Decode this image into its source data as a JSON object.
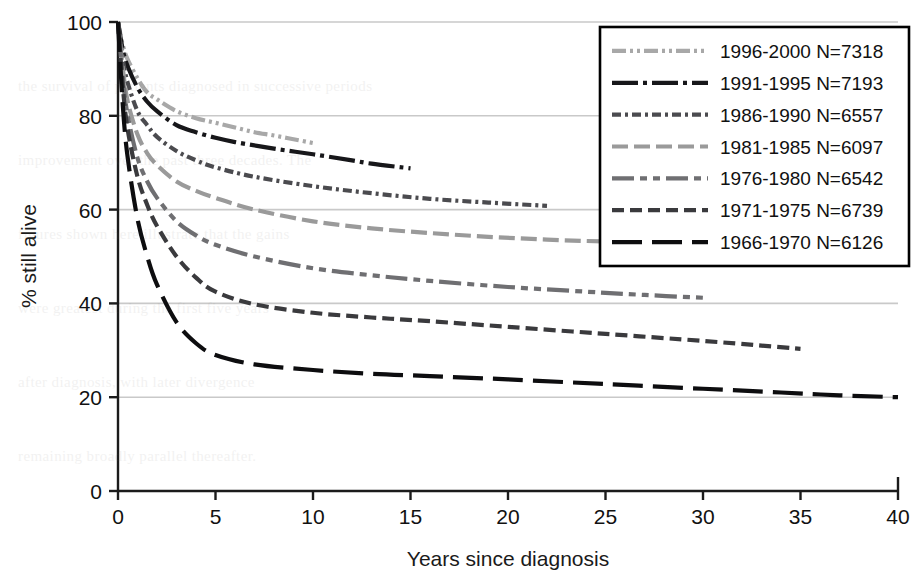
{
  "figure": {
    "background": "#ffffff",
    "plot": {
      "x0": 118,
      "x1": 898,
      "y0": 491,
      "y1": 22
    },
    "gridline_color": "#c9c9c9",
    "axis_color": "#1b1b1b"
  },
  "axes": {
    "x": {
      "label": "Years since diagnosis",
      "min": 0,
      "max": 40,
      "ticks": [
        0,
        5,
        10,
        15,
        20,
        25,
        30,
        35,
        40
      ],
      "tick_labels": [
        "0",
        "5",
        "10",
        "15",
        "20",
        "25",
        "30",
        "35",
        "40"
      ]
    },
    "y": {
      "label": "% still alive",
      "min": 0,
      "max": 100,
      "ticks": [
        0,
        20,
        40,
        60,
        80,
        100
      ],
      "tick_labels": [
        "0",
        "20",
        "40",
        "60",
        "80",
        "100"
      ]
    }
  },
  "legend": {
    "box": {
      "x": 600,
      "y": 27,
      "width": 309,
      "height": 239
    },
    "border_color": "#000000",
    "background": "#ffffff",
    "entries": [
      {
        "label": "1996-2000 N=7318",
        "period": "1996-2000",
        "n": 7318,
        "color": "#a8a8a8",
        "dash": "14,4,3,4,3,4"
      },
      {
        "label": "1991-1995 N=7193",
        "period": "1991-1995",
        "n": 7193,
        "color": "#17171a",
        "dash": "26,5,4,5"
      },
      {
        "label": "1986-1990 N=6557",
        "period": "1986-1990",
        "n": 6557,
        "color": "#4b4b4f",
        "dash": "9,4,3,4"
      },
      {
        "label": "1981-1985 N=6097",
        "period": "1981-1985",
        "n": 6097,
        "color": "#9a9a9a",
        "dash": "16,6"
      },
      {
        "label": "1976-1980 N=6542",
        "period": "1976-1980",
        "n": 6542,
        "color": "#6f6f72",
        "dash": "22,6,7,6,7,6"
      },
      {
        "label": "1971-1975 N=6739",
        "period": "1971-1975",
        "n": 6739,
        "color": "#3a3a3d",
        "dash": "12,6"
      },
      {
        "label": "1966-1970 N=6126",
        "period": "1966-1970",
        "n": 6126,
        "color": "#0d0d0f",
        "dash": "30,10"
      }
    ]
  },
  "chart_data": {
    "type": "line",
    "title": "",
    "xlabel": "Years since diagnosis",
    "ylabel": "% still alive",
    "xlim": [
      0,
      40
    ],
    "ylim": [
      0,
      100
    ],
    "grid": "horizontal",
    "legend_position": "top-right",
    "series": [
      {
        "name": "1996-2000 N=7318",
        "color": "#a8a8a8",
        "dash": "14,4,3,4,3,4",
        "x": [
          0,
          0.25,
          0.5,
          1,
          1.5,
          2,
          3,
          4,
          5,
          6,
          7,
          8,
          9,
          10
        ],
        "y": [
          100,
          95,
          92,
          88,
          85,
          83.5,
          81,
          79.5,
          78.5,
          77.5,
          76.5,
          75.8,
          75,
          74.2
        ]
      },
      {
        "name": "1991-1995 N=7193",
        "color": "#17171a",
        "dash": "26,5,4,5",
        "x": [
          0,
          0.25,
          0.5,
          1,
          1.5,
          2,
          3,
          4,
          5,
          6,
          8,
          10,
          12,
          13,
          15
        ],
        "y": [
          100,
          94,
          90.5,
          86,
          83,
          81,
          78,
          76.5,
          75.3,
          74.4,
          73,
          71.8,
          70.5,
          69.8,
          68.8
        ]
      },
      {
        "name": "1986-1990 N=6557",
        "color": "#4b4b4f",
        "dash": "9,4,3,4",
        "x": [
          0,
          0.25,
          0.5,
          1,
          1.5,
          2,
          3,
          4,
          5,
          7,
          10,
          13,
          16,
          19,
          22
        ],
        "y": [
          100,
          92,
          87,
          81,
          78,
          75.5,
          72.5,
          70.5,
          69,
          67,
          65,
          63.5,
          62.3,
          61.5,
          60.8
        ]
      },
      {
        "name": "1981-1985 N=6097",
        "color": "#9a9a9a",
        "dash": "16,6",
        "x": [
          0,
          0.25,
          0.5,
          1,
          1.5,
          2,
          3,
          4,
          5,
          7,
          10,
          13,
          16,
          19,
          22,
          25,
          28
        ],
        "y": [
          100,
          90,
          83,
          76,
          72,
          69.5,
          66,
          64,
          62.5,
          60,
          57.5,
          56,
          55,
          54.2,
          53.6,
          53.2,
          53.0
        ]
      },
      {
        "name": "1976-1980 N=6542",
        "color": "#6f6f72",
        "dash": "22,6,7,6,7,6",
        "x": [
          0,
          0.25,
          0.5,
          1,
          1.5,
          2,
          3,
          4,
          5,
          7,
          10,
          13,
          16,
          20,
          24,
          27,
          30
        ],
        "y": [
          100,
          88,
          80,
          71,
          66,
          62.5,
          57.5,
          54.5,
          52.5,
          50,
          47.5,
          46,
          44.8,
          43.5,
          42.5,
          41.8,
          41.2
        ]
      },
      {
        "name": "1971-1975 N=6739",
        "color": "#3a3a3d",
        "dash": "12,6",
        "x": [
          0,
          0.25,
          0.5,
          1,
          1.5,
          2,
          3,
          4,
          5,
          7,
          10,
          13,
          16,
          20,
          25,
          30,
          33,
          35
        ],
        "y": [
          100,
          86,
          77,
          67,
          61,
          56.5,
          50,
          45.5,
          42.5,
          39.8,
          38,
          37,
          36.2,
          35,
          33.5,
          32,
          31,
          30.3
        ]
      },
      {
        "name": "1966-1970 N=6126",
        "color": "#0d0d0f",
        "dash": "30,10",
        "x": [
          0,
          0.25,
          0.5,
          1,
          1.5,
          2,
          3,
          4,
          5,
          7,
          10,
          13,
          16,
          20,
          25,
          30,
          34,
          37,
          40
        ],
        "y": [
          100,
          82,
          71,
          58,
          50,
          44,
          36,
          31.5,
          29,
          27,
          25.8,
          25,
          24.5,
          23.8,
          22.8,
          21.8,
          21,
          20.4,
          20.0
        ]
      }
    ]
  },
  "background_text": {
    "lines": [
      "the survival of patients diagnosed in successive periods",
      "improvement over the past three decades. The",
      "figures shown here illustrate that the gains",
      "were greatest during the first five years",
      "after diagnosis, with later divergence",
      "remaining broadly parallel thereafter."
    ]
  }
}
